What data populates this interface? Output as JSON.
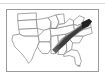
{
  "figure": {
    "type": "map",
    "title": "",
    "caption": "",
    "has_top_rule": true,
    "frame": {
      "visible": true,
      "border_color": "#9a9a9a",
      "background_color": "#ffffff"
    }
  },
  "map": {
    "region_name": "Southern and Southeastern United States",
    "projection_hint": "plate-carree",
    "state_outline_color": "#7d7d7d",
    "state_fill_color": "#ffffff",
    "states_shown": [
      "Texas",
      "Oklahoma",
      "Kansas",
      "Nebraska",
      "Missouri",
      "Arkansas",
      "Louisiana",
      "Mississippi",
      "Alabama",
      "Tennessee",
      "Kentucky",
      "Illinois",
      "Indiana",
      "Georgia",
      "Florida",
      "South Carolina",
      "North Carolina",
      "Virginia",
      "West Virginia"
    ],
    "shaded_overlay": {
      "label": "Shaded distribution band",
      "color_dark": "#3a3a3a",
      "color_mid": "#6e6e6e",
      "color_light": "#a5a5a5",
      "description": "Dark diagonal band running from northeastern Mississippi and northern Alabama northeast through Tennessee into the Carolinas and Virginia, following the Appalachian trend",
      "covered_states": [
        "Mississippi",
        "Alabama",
        "Tennessee",
        "Georgia",
        "South Carolina",
        "North Carolina",
        "Virginia"
      ]
    },
    "corner_mark": {
      "present": true,
      "position": "bottom-right",
      "description": "small dark tick mark near lower right inside frame"
    }
  }
}
